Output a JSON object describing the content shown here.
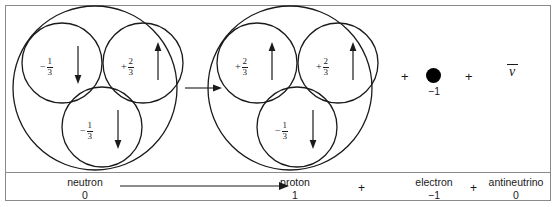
{
  "figure": {
    "background": "#ffffff",
    "frame_color": "#8a8a8a",
    "ink_color": "#1a1a1a"
  },
  "particles": [
    {
      "id": "neutron",
      "name": "neutron",
      "charge": "0",
      "quarks": [
        {
          "charge_sign": "−",
          "numerator": "1",
          "denominator": "3",
          "spin": "down"
        },
        {
          "charge_sign": "+",
          "numerator": "2",
          "denominator": "3",
          "spin": "up"
        },
        {
          "charge_sign": "−",
          "numerator": "1",
          "denominator": "3",
          "spin": "down"
        }
      ]
    },
    {
      "id": "proton",
      "name": "proton",
      "charge": "1",
      "quarks": [
        {
          "charge_sign": "+",
          "numerator": "2",
          "denominator": "3",
          "spin": "up"
        },
        {
          "charge_sign": "+",
          "numerator": "2",
          "denominator": "3",
          "spin": "up"
        },
        {
          "charge_sign": "−",
          "numerator": "1",
          "denominator": "3",
          "spin": "down"
        }
      ]
    },
    {
      "id": "electron",
      "name": "electron",
      "charge": "−1",
      "symbol": "●"
    },
    {
      "id": "antineutrino",
      "name": "antineutrino",
      "charge": "0",
      "symbol": "ν",
      "overbar": true
    }
  ],
  "operators": {
    "plus": "+",
    "reaction_arrow": "→"
  },
  "bottom_row": {
    "neutron_label": "neutron",
    "neutron_charge": "0",
    "proton_label": "proton",
    "proton_charge": "1",
    "electron_label": "electron",
    "electron_charge": "−1",
    "antineutrino_label": "antineutrino",
    "antineutrino_charge": "0",
    "plus_1": "+",
    "plus_2": "+"
  },
  "top_row": {
    "plus_1": "+",
    "plus_2": "+"
  },
  "chart_data": {
    "type": "diagram",
    "reaction": "neutron (0) → proton (1) + electron (−1) + antineutrino (0)",
    "nodes": [
      {
        "label": "neutron",
        "charge": 0,
        "quark_charges": [
          "-1/3",
          "+2/3",
          "-1/3"
        ],
        "quark_spins": [
          "down",
          "up",
          "down"
        ]
      },
      {
        "label": "proton",
        "charge": 1,
        "quark_charges": [
          "+2/3",
          "+2/3",
          "-1/3"
        ],
        "quark_spins": [
          "up",
          "up",
          "down"
        ]
      },
      {
        "label": "electron",
        "charge": -1,
        "quark_charges": [],
        "quark_spins": []
      },
      {
        "label": "antineutrino",
        "charge": 0,
        "quark_charges": [],
        "quark_spins": []
      }
    ]
  }
}
